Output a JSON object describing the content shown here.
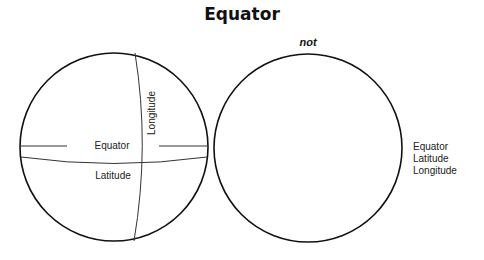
{
  "title": "Equator",
  "left_globe": {
    "labels": {
      "equator": "Equator",
      "latitude": "Latitude",
      "longitude": "Longitude"
    }
  },
  "right_globe": {
    "annotation": "not"
  },
  "word_bank": [
    "Equator",
    "Latitude",
    "Longitude"
  ]
}
